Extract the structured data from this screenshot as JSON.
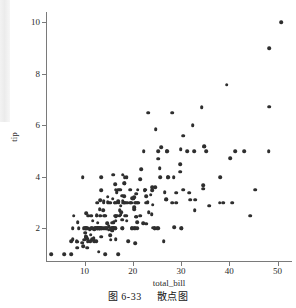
{
  "figure": {
    "caption_number": "图 6-33",
    "caption_text": "散点图"
  },
  "chart_data": {
    "type": "scatter",
    "title": "",
    "xlabel": "total_bill",
    "ylabel": "tip",
    "xlim": [
      2.0,
      53.0
    ],
    "ylim": [
      0.7,
      10.4
    ],
    "xticks": [
      10,
      20,
      30,
      40,
      50
    ],
    "yticks": [
      2,
      4,
      6,
      8,
      10
    ],
    "xticklabels": [
      "10",
      "20",
      "30",
      "40",
      "50"
    ],
    "yticklabels": [
      "2",
      "4",
      "6",
      "8",
      "10"
    ],
    "grid": false,
    "legend": null,
    "marker": "circle",
    "marker_color": "#2e2e2e",
    "marker_size": 4,
    "n_points": 244,
    "x": [
      16.99,
      10.34,
      21.01,
      23.68,
      24.59,
      25.29,
      8.77,
      26.88,
      15.04,
      14.78,
      10.27,
      35.26,
      15.42,
      18.43,
      14.83,
      21.58,
      10.33,
      16.29,
      16.97,
      20.65,
      17.92,
      20.29,
      15.77,
      39.42,
      19.82,
      17.81,
      13.37,
      12.69,
      21.7,
      19.65,
      9.55,
      18.35,
      15.06,
      20.69,
      17.78,
      24.06,
      16.31,
      16.93,
      18.69,
      31.27,
      16.04,
      17.46,
      13.94,
      9.68,
      30.4,
      18.29,
      22.23,
      32.4,
      28.55,
      18.04,
      12.54,
      10.29,
      34.81,
      9.94,
      25.56,
      19.49,
      38.01,
      26.41,
      11.24,
      48.27,
      20.29,
      13.81,
      11.02,
      18.29,
      17.59,
      20.08,
      16.45,
      3.07,
      20.23,
      15.01,
      12.02,
      17.07,
      26.86,
      25.28,
      14.73,
      10.51,
      17.92,
      27.2,
      22.76,
      17.29,
      19.44,
      16.66,
      10.07,
      32.68,
      15.98,
      34.83,
      13.03,
      18.28,
      24.71,
      21.16,
      28.97,
      22.49,
      5.75,
      16.32,
      22.75,
      40.17,
      27.28,
      12.03,
      21.01,
      12.46,
      11.35,
      15.38,
      44.3,
      22.42,
      20.92,
      15.36,
      20.49,
      25.21,
      18.24,
      14.31,
      14.0,
      7.25,
      38.07,
      23.95,
      25.71,
      17.31,
      29.93,
      10.65,
      12.43,
      24.08,
      11.69,
      13.42,
      14.26,
      15.95,
      12.48,
      29.8,
      8.52,
      14.52,
      11.38,
      22.82,
      19.08,
      20.27,
      11.17,
      12.26,
      18.26,
      8.51,
      10.33,
      14.15,
      16.0,
      13.16,
      17.47,
      34.3,
      41.19,
      27.05,
      16.43,
      8.35,
      18.64,
      11.87,
      9.78,
      7.51,
      14.07,
      13.13,
      17.26,
      24.55,
      19.77,
      29.85,
      48.17,
      25.0,
      13.39,
      16.49,
      21.5,
      12.66,
      16.21,
      13.81,
      17.51,
      24.52,
      20.76,
      31.71,
      10.59,
      10.63,
      50.81,
      15.81,
      7.25,
      31.85,
      16.82,
      32.9,
      17.89,
      14.48,
      9.6,
      34.63,
      34.65,
      23.33,
      45.35,
      23.17,
      40.55,
      20.69,
      20.9,
      30.46,
      18.15,
      23.1,
      15.69,
      19.81,
      28.44,
      15.48,
      16.58,
      7.56,
      10.34,
      43.11,
      13.0,
      13.51,
      18.71,
      12.74,
      13.0,
      16.4,
      20.53,
      16.47,
      26.59,
      38.73,
      24.27,
      12.76,
      30.06,
      25.89,
      48.33,
      13.27,
      28.17,
      12.9,
      28.15,
      11.59,
      7.74,
      30.14,
      12.16,
      13.42,
      8.58,
      15.98,
      13.42,
      16.27,
      10.09,
      20.45,
      13.28,
      22.12,
      24.01,
      15.69,
      11.61,
      10.77,
      15.53,
      10.07,
      12.6,
      32.83,
      35.83,
      29.03,
      27.18,
      22.67,
      17.82,
      18.78
    ],
    "y": [
      1.01,
      1.66,
      3.5,
      3.31,
      3.61,
      4.71,
      2.0,
      3.12,
      1.96,
      3.23,
      1.71,
      5.0,
      1.57,
      3.0,
      3.02,
      3.92,
      1.67,
      3.71,
      3.5,
      3.35,
      4.08,
      2.75,
      2.23,
      7.58,
      3.18,
      2.34,
      2.0,
      2.0,
      4.3,
      3.0,
      1.45,
      2.5,
      3.0,
      2.45,
      3.27,
      3.6,
      2.0,
      3.07,
      2.31,
      5.0,
      2.24,
      2.54,
      3.06,
      1.32,
      5.6,
      3.0,
      5.0,
      6.0,
      2.05,
      3.0,
      2.5,
      2.6,
      5.2,
      1.56,
      4.34,
      3.51,
      3.0,
      1.5,
      1.76,
      6.73,
      3.21,
      2.0,
      1.98,
      3.76,
      2.64,
      3.15,
      2.47,
      1.0,
      2.01,
      2.09,
      1.97,
      3.0,
      3.14,
      5.0,
      2.2,
      1.25,
      3.08,
      4.0,
      3.0,
      2.71,
      3.0,
      3.4,
      1.83,
      5.0,
      2.03,
      5.17,
      2.0,
      4.0,
      5.85,
      3.0,
      3.0,
      3.5,
      1.0,
      2.01,
      3.25,
      4.73,
      4.0,
      1.5,
      3.0,
      1.5,
      2.5,
      3.0,
      2.5,
      3.48,
      2.24,
      1.73,
      2.0,
      2.0,
      3.76,
      1.0,
      3.0,
      1.0,
      4.0,
      2.55,
      4.0,
      3.5,
      5.07,
      1.5,
      2.0,
      2.92,
      2.31,
      1.68,
      2.5,
      2.0,
      2.52,
      4.2,
      1.48,
      2.0,
      2.0,
      2.18,
      1.5,
      2.83,
      1.5,
      2.0,
      3.25,
      1.25,
      2.0,
      2.0,
      2.0,
      2.75,
      3.5,
      6.7,
      5.0,
      5.0,
      2.3,
      1.5,
      2.5,
      1.63,
      2.0,
      2.0,
      2.5,
      2.0,
      2.5,
      2.0,
      2.0,
      4.5,
      5.0,
      2.0,
      2.0,
      1.58,
      2.5,
      2.0,
      3.0,
      2.72,
      2.88,
      2.0,
      3.0,
      3.39,
      1.61,
      2.0,
      10.0,
      3.16,
      1.5,
      3.11,
      2.5,
      3.11,
      2.0,
      2.0,
      4.0,
      3.55,
      3.68,
      2.64,
      3.5,
      6.5,
      3.0,
      2.45,
      2.0,
      3.5,
      3.0,
      3.02,
      2.0,
      2.0,
      4.0,
      1.97,
      3.0,
      1.58,
      2.0,
      5.0,
      2.0,
      2.0,
      4.0,
      2.0,
      2.0,
      2.5,
      3.0,
      3.5,
      3.41,
      3.0,
      2.03,
      2.23,
      2.0,
      5.16,
      9.0,
      2.5,
      6.5,
      1.1,
      3.0,
      2.0,
      2.5,
      2.0,
      2.0,
      3.48,
      2.24,
      4.08,
      4.0,
      3.0,
      2.0,
      1.44,
      3.09,
      2.2,
      3.48,
      1.92,
      1.58,
      2.5,
      2.0,
      2.0,
      3.0,
      2.72,
      2.88,
      3.39,
      5.0,
      3.5,
      2.0,
      3.0
    ]
  }
}
